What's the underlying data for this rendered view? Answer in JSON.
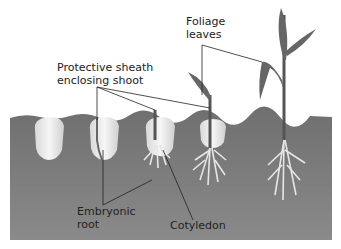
{
  "diagram": {
    "labels": {
      "foliage_line1": "Foliage",
      "foliage_line2": "leaves",
      "sheath_line1": "Protective sheath",
      "sheath_line2": "enclosing shoot",
      "root_line1": "Embryonic",
      "root_line2": "root",
      "cotyledon": "Cotyledon"
    },
    "stages": 5,
    "colors": {
      "soil": "#7a7a7a",
      "seed": "#efefef",
      "stem": "#555555",
      "roots": "#e6e6e6",
      "leader_lines": "#222222"
    }
  }
}
